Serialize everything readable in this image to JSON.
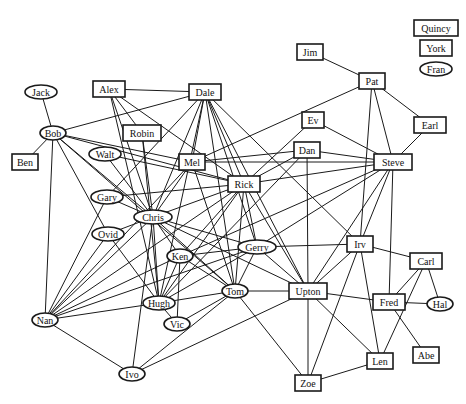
{
  "diagram": {
    "type": "social-network-graph",
    "nodes": [
      {
        "id": "Quincy",
        "label": "Quincy",
        "shape": "rect",
        "x": 436,
        "y": 28
      },
      {
        "id": "York",
        "label": "York",
        "shape": "rect",
        "x": 436,
        "y": 48
      },
      {
        "id": "Fran",
        "label": "Fran",
        "shape": "ellipse",
        "x": 436,
        "y": 69
      },
      {
        "id": "Jim",
        "label": "Jim",
        "shape": "rect",
        "x": 310,
        "y": 52
      },
      {
        "id": "Pat",
        "label": "Pat",
        "shape": "rect",
        "x": 372,
        "y": 81
      },
      {
        "id": "Jack",
        "label": "Jack",
        "shape": "ellipse",
        "x": 41,
        "y": 92
      },
      {
        "id": "Alex",
        "label": "Alex",
        "shape": "rect",
        "x": 109,
        "y": 89
      },
      {
        "id": "Dale",
        "label": "Dale",
        "shape": "rect",
        "x": 205,
        "y": 92
      },
      {
        "id": "Earl",
        "label": "Earl",
        "shape": "rect",
        "x": 430,
        "y": 125
      },
      {
        "id": "Ev",
        "label": "Ev",
        "shape": "rect",
        "x": 313,
        "y": 120
      },
      {
        "id": "Dan",
        "label": "Dan",
        "shape": "rect",
        "x": 307,
        "y": 150
      },
      {
        "id": "Steve",
        "label": "Steve",
        "shape": "rect",
        "x": 393,
        "y": 162
      },
      {
        "id": "Bob",
        "label": "Bob",
        "shape": "ellipse",
        "x": 53,
        "y": 133
      },
      {
        "id": "Robin",
        "label": "Robin",
        "shape": "rect",
        "x": 142,
        "y": 133
      },
      {
        "id": "Ben",
        "label": "Ben",
        "shape": "rect",
        "x": 25,
        "y": 162
      },
      {
        "id": "Walt",
        "label": "Walt",
        "shape": "ellipse",
        "x": 105,
        "y": 154
      },
      {
        "id": "Mel",
        "label": "Mel",
        "shape": "rect",
        "x": 192,
        "y": 162
      },
      {
        "id": "Rick",
        "label": "Rick",
        "shape": "rect",
        "x": 244,
        "y": 184
      },
      {
        "id": "Gary",
        "label": "Gary",
        "shape": "ellipse",
        "x": 107,
        "y": 197
      },
      {
        "id": "Chris",
        "label": "Chris",
        "shape": "ellipse",
        "x": 153,
        "y": 217
      },
      {
        "id": "Ovid",
        "label": "Ovid",
        "shape": "ellipse",
        "x": 108,
        "y": 234
      },
      {
        "id": "Ken",
        "label": "Ken",
        "shape": "ellipse",
        "x": 180,
        "y": 256
      },
      {
        "id": "Gerry",
        "label": "Gerry",
        "shape": "ellipse",
        "x": 257,
        "y": 247
      },
      {
        "id": "Irv",
        "label": "Irv",
        "shape": "rect",
        "x": 360,
        "y": 244
      },
      {
        "id": "Carl",
        "label": "Carl",
        "shape": "rect",
        "x": 426,
        "y": 261
      },
      {
        "id": "Tom",
        "label": "Tom",
        "shape": "ellipse",
        "x": 235,
        "y": 291
      },
      {
        "id": "Upton",
        "label": "Upton",
        "shape": "rect",
        "x": 308,
        "y": 291
      },
      {
        "id": "Hugh",
        "label": "Hugh",
        "shape": "ellipse",
        "x": 159,
        "y": 303
      },
      {
        "id": "Fred",
        "label": "Fred",
        "shape": "rect",
        "x": 389,
        "y": 302
      },
      {
        "id": "Hal",
        "label": "Hal",
        "shape": "ellipse",
        "x": 440,
        "y": 304
      },
      {
        "id": "Nan",
        "label": "Nan",
        "shape": "ellipse",
        "x": 45,
        "y": 320
      },
      {
        "id": "Vic",
        "label": "Vic",
        "shape": "ellipse",
        "x": 177,
        "y": 324
      },
      {
        "id": "Len",
        "label": "Len",
        "shape": "rect",
        "x": 380,
        "y": 361
      },
      {
        "id": "Abe",
        "label": "Abe",
        "shape": "rect",
        "x": 426,
        "y": 355
      },
      {
        "id": "Ivo",
        "label": "Ivo",
        "shape": "ellipse",
        "x": 132,
        "y": 374
      },
      {
        "id": "Zoe",
        "label": "Zoe",
        "shape": "rect",
        "x": 308,
        "y": 383
      }
    ],
    "edges": [
      [
        "Jim",
        "Pat"
      ],
      [
        "Pat",
        "Earl"
      ],
      [
        "Pat",
        "Mel"
      ],
      [
        "Pat",
        "Steve"
      ],
      [
        "Pat",
        "Irv"
      ],
      [
        "Earl",
        "Steve"
      ],
      [
        "Jack",
        "Bob"
      ],
      [
        "Bob",
        "Ben"
      ],
      [
        "Bob",
        "Dale"
      ],
      [
        "Bob",
        "Mel"
      ],
      [
        "Bob",
        "Rick"
      ],
      [
        "Bob",
        "Nan"
      ],
      [
        "Bob",
        "Ovid"
      ],
      [
        "Bob",
        "Chris"
      ],
      [
        "Bob",
        "Tom"
      ],
      [
        "Alex",
        "Dale"
      ],
      [
        "Alex",
        "Robin"
      ],
      [
        "Alex",
        "Chris"
      ],
      [
        "Alex",
        "Rick"
      ],
      [
        "Alex",
        "Hugh"
      ],
      [
        "Dale",
        "Gary"
      ],
      [
        "Dale",
        "Chris"
      ],
      [
        "Dale",
        "Mel"
      ],
      [
        "Dale",
        "Rick"
      ],
      [
        "Dale",
        "Tom"
      ],
      [
        "Dale",
        "Gerry"
      ],
      [
        "Dale",
        "Irv"
      ],
      [
        "Dale",
        "Hugh"
      ],
      [
        "Dale",
        "Upton"
      ],
      [
        "Robin",
        "Chris"
      ],
      [
        "Robin",
        "Hugh"
      ],
      [
        "Walt",
        "Chris"
      ],
      [
        "Walt",
        "Rick"
      ],
      [
        "Mel",
        "Chris"
      ],
      [
        "Mel",
        "Dan"
      ],
      [
        "Mel",
        "Tom"
      ],
      [
        "Mel",
        "Nan"
      ],
      [
        "Mel",
        "Steve"
      ],
      [
        "Ev",
        "Steve"
      ],
      [
        "Ev",
        "Rick"
      ],
      [
        "Dan",
        "Rick"
      ],
      [
        "Dan",
        "Hugh"
      ],
      [
        "Dan",
        "Steve"
      ],
      [
        "Dan",
        "Upton"
      ],
      [
        "Steve",
        "Rick"
      ],
      [
        "Steve",
        "Irv"
      ],
      [
        "Steve",
        "Upton"
      ],
      [
        "Steve",
        "Fred"
      ],
      [
        "Steve",
        "Gerry"
      ],
      [
        "Steve",
        "Ken"
      ],
      [
        "Rick",
        "Gary"
      ],
      [
        "Rick",
        "Chris"
      ],
      [
        "Rick",
        "Ken"
      ],
      [
        "Rick",
        "Tom"
      ],
      [
        "Rick",
        "Hugh"
      ],
      [
        "Rick",
        "Upton"
      ],
      [
        "Rick",
        "Gerry"
      ],
      [
        "Rick",
        "Nan"
      ],
      [
        "Gary",
        "Chris"
      ],
      [
        "Gary",
        "Nan"
      ],
      [
        "Chris",
        "Ovid"
      ],
      [
        "Chris",
        "Nan"
      ],
      [
        "Chris",
        "Ken"
      ],
      [
        "Chris",
        "Gerry"
      ],
      [
        "Chris",
        "Tom"
      ],
      [
        "Chris",
        "Hugh"
      ],
      [
        "Chris",
        "Ivo"
      ],
      [
        "Chris",
        "Upton"
      ],
      [
        "Ovid",
        "Nan"
      ],
      [
        "Ovid",
        "Hugh"
      ],
      [
        "Ken",
        "Gerry"
      ],
      [
        "Ken",
        "Tom"
      ],
      [
        "Ken",
        "Hugh"
      ],
      [
        "Ken",
        "Vic"
      ],
      [
        "Ken",
        "Nan"
      ],
      [
        "Gerry",
        "Irv"
      ],
      [
        "Gerry",
        "Hugh"
      ],
      [
        "Gerry",
        "Tom"
      ],
      [
        "Gerry",
        "Upton"
      ],
      [
        "Gerry",
        "Nan"
      ],
      [
        "Irv",
        "Carl"
      ],
      [
        "Irv",
        "Len"
      ],
      [
        "Irv",
        "Zoe"
      ],
      [
        "Irv",
        "Upton"
      ],
      [
        "Carl",
        "Fred"
      ],
      [
        "Carl",
        "Hal"
      ],
      [
        "Carl",
        "Len"
      ],
      [
        "Tom",
        "Upton"
      ],
      [
        "Tom",
        "Hugh"
      ],
      [
        "Tom",
        "Vic"
      ],
      [
        "Tom",
        "Zoe"
      ],
      [
        "Tom",
        "Ivo"
      ],
      [
        "Upton",
        "Fred"
      ],
      [
        "Upton",
        "Zoe"
      ],
      [
        "Upton",
        "Len"
      ],
      [
        "Upton",
        "Ivo"
      ],
      [
        "Hugh",
        "Nan"
      ],
      [
        "Hugh",
        "Vic"
      ],
      [
        "Fred",
        "Hal"
      ],
      [
        "Fred",
        "Abe"
      ],
      [
        "Nan",
        "Ivo"
      ],
      [
        "Zoe",
        "Len"
      ]
    ]
  }
}
